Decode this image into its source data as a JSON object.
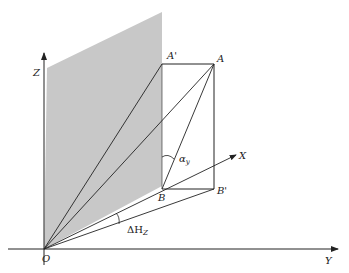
{
  "diagram": {
    "type": "3d-coordinate-geometry",
    "colors": {
      "line": "#222222",
      "shade": "#c8c8c8",
      "background": "#ffffff"
    },
    "axes": {
      "z_label": "Z",
      "x_label": "X",
      "y_label": "Y",
      "origin_label": "O"
    },
    "points": {
      "A": "A",
      "A_prime": "A'",
      "B": "B",
      "B_prime": "B'"
    },
    "angles": {
      "alpha_main": "α",
      "alpha_sub": "y",
      "delta_main": "ΔH",
      "delta_sub": "Z"
    }
  }
}
